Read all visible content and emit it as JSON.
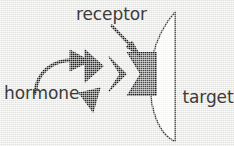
{
  "figure": {
    "background_color": "#e9e9e7",
    "labels": {
      "receptor": "receptor",
      "hormone": "hormone",
      "target_cell_line1": "target",
      "target_cell_line2": "cell"
    },
    "colors": {
      "hormone_fill": "#2b2b2b",
      "receptor_fill": "#4d4d4d",
      "receptor_outline": "#1e1e1e",
      "cell_fill": "#fdfdfc",
      "cell_outline": "#3a3a3a",
      "arrow": "#1f1f1f",
      "text": "#3b3b3b"
    },
    "shapes": [
      {
        "name": "hormone-triangle-bound",
        "kind": "triangle",
        "state": "bound"
      },
      {
        "name": "hormone-triangle-approaching",
        "kind": "triangle",
        "state": "approaching"
      },
      {
        "name": "hormone-triangle-free-upper",
        "kind": "triangle",
        "state": "free"
      },
      {
        "name": "hormone-triangle-free-lower",
        "kind": "triangle",
        "state": "free"
      },
      {
        "name": "receptor-block",
        "kind": "notched-block",
        "state": "embedded-in-membrane"
      },
      {
        "name": "target-cell",
        "kind": "crescent",
        "state": "static"
      }
    ],
    "arrows": [
      {
        "name": "hormone-curved-arrow",
        "from": "hormone",
        "to": "hormone-triangle-free-upper",
        "style": "curved"
      },
      {
        "name": "receptor-pointer-arrow",
        "from": "receptor",
        "to": "receptor-block",
        "style": "straight-diagonal"
      }
    ]
  }
}
